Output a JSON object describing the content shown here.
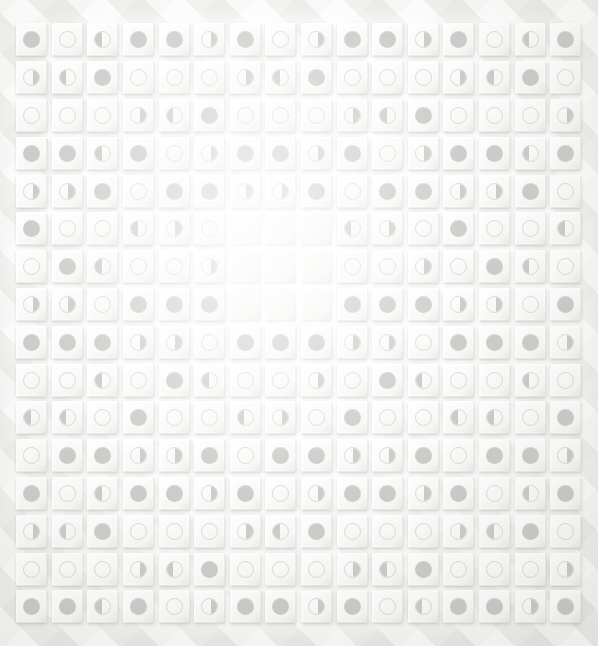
{
  "app": {
    "title": "Moon Phase Logic Grid",
    "view": "puzzle-board"
  },
  "board": {
    "rows": 16,
    "columns": 16,
    "cell_states": [
      "full",
      "empty",
      "half-left",
      "half-right",
      "blank"
    ],
    "colors": {
      "marker_fill": "#b7b7b5",
      "marker_outline": "#c9c9c6",
      "tile_face": "#ffffff",
      "tile_shadow": "#96968f",
      "background": "#eaeae7"
    },
    "grid": [
      [
        "full",
        "empty",
        "half-left",
        "full",
        "full",
        "half-right",
        "full",
        "empty",
        "half-right",
        "full",
        "full",
        "half-right",
        "full",
        "empty",
        "half-left",
        "full"
      ],
      [
        "half-right",
        "half-left",
        "full",
        "empty",
        "empty",
        "empty",
        "half-right",
        "half-left",
        "full",
        "empty",
        "empty",
        "empty",
        "half-right",
        "half-left",
        "full",
        "empty"
      ],
      [
        "empty",
        "empty",
        "empty",
        "half-right",
        "half-left",
        "full",
        "empty",
        "empty",
        "empty",
        "half-right",
        "half-left",
        "full",
        "empty",
        "empty",
        "empty",
        "half-right"
      ],
      [
        "full",
        "full",
        "half-left",
        "full",
        "empty",
        "half-right",
        "full",
        "full",
        "half-right",
        "full",
        "empty",
        "half-right",
        "full",
        "full",
        "half-left",
        "full"
      ],
      [
        "half-right",
        "half-right",
        "full",
        "empty",
        "full",
        "full",
        "half-right",
        "half-right",
        "full",
        "empty",
        "full",
        "full",
        "half-right",
        "half-right",
        "full",
        "empty"
      ],
      [
        "full",
        "empty",
        "empty",
        "half-left",
        "half-right",
        "empty",
        "blank",
        "blank",
        "blank",
        "half-left",
        "half-right",
        "empty",
        "full",
        "empty",
        "empty",
        "half-left"
      ],
      [
        "empty",
        "full",
        "half-left",
        "empty",
        "empty",
        "half-right",
        "blank",
        "blank",
        "blank",
        "empty",
        "empty",
        "half-right",
        "empty",
        "full",
        "half-left",
        "empty"
      ],
      [
        "half-right",
        "half-right",
        "empty",
        "full",
        "full",
        "full",
        "blank",
        "blank",
        "blank",
        "full",
        "full",
        "full",
        "half-right",
        "half-right",
        "empty",
        "full"
      ],
      [
        "full",
        "full",
        "full",
        "half-right",
        "half-right",
        "empty",
        "full",
        "full",
        "full",
        "half-right",
        "half-right",
        "empty",
        "full",
        "full",
        "full",
        "half-right"
      ],
      [
        "empty",
        "empty",
        "half-left",
        "empty",
        "full",
        "half-left",
        "empty",
        "empty",
        "half-right",
        "empty",
        "full",
        "half-left",
        "empty",
        "empty",
        "half-left",
        "empty"
      ],
      [
        "half-left",
        "half-left",
        "empty",
        "full",
        "empty",
        "empty",
        "half-left",
        "half-right",
        "empty",
        "full",
        "empty",
        "empty",
        "half-left",
        "half-left",
        "empty",
        "full"
      ],
      [
        "empty",
        "full",
        "full",
        "half-right",
        "half-right",
        "full",
        "empty",
        "full",
        "full",
        "half-right",
        "half-right",
        "full",
        "empty",
        "full",
        "full",
        "half-right"
      ],
      [
        "full",
        "empty",
        "half-left",
        "full",
        "full",
        "half-right",
        "full",
        "empty",
        "half-right",
        "full",
        "full",
        "half-right",
        "full",
        "empty",
        "half-left",
        "full"
      ],
      [
        "half-right",
        "half-left",
        "full",
        "empty",
        "empty",
        "empty",
        "half-right",
        "half-left",
        "full",
        "empty",
        "empty",
        "empty",
        "half-right",
        "half-left",
        "full",
        "empty"
      ],
      [
        "empty",
        "empty",
        "empty",
        "half-right",
        "half-left",
        "full",
        "empty",
        "empty",
        "empty",
        "half-right",
        "half-left",
        "full",
        "empty",
        "empty",
        "empty",
        "half-right"
      ],
      [
        "full",
        "full",
        "half-left",
        "full",
        "empty",
        "half-right",
        "full",
        "full",
        "half-right",
        "full",
        "empty",
        "half-left",
        "full",
        "full",
        "half-right",
        "full"
      ]
    ]
  }
}
